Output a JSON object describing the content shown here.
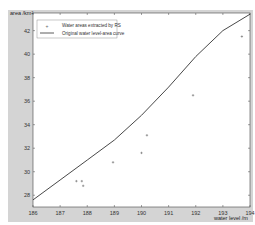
{
  "chart_data": {
    "type": "scatter",
    "title": "",
    "xlabel": "water level /m",
    "ylabel": "area /km²",
    "xlim": [
      186,
      194
    ],
    "ylim": [
      27,
      43.5
    ],
    "x_ticks": [
      186,
      187,
      188,
      189,
      190,
      191,
      192,
      193,
      194
    ],
    "y_ticks": [
      28,
      30,
      32,
      34,
      36,
      38,
      40,
      42
    ],
    "grid": false,
    "legend_position": "upper left",
    "series": [
      {
        "name": "Water areas extracted by RS",
        "kind": "scatter",
        "marker": "+",
        "points": [
          {
            "x": 187.6,
            "y": 29.2
          },
          {
            "x": 187.8,
            "y": 29.2
          },
          {
            "x": 187.85,
            "y": 28.8
          },
          {
            "x": 188.95,
            "y": 30.8
          },
          {
            "x": 190.0,
            "y": 31.6
          },
          {
            "x": 190.2,
            "y": 33.1
          },
          {
            "x": 191.9,
            "y": 36.5
          },
          {
            "x": 193.7,
            "y": 41.5
          }
        ]
      },
      {
        "name": "Original water level-area curve",
        "kind": "line",
        "points": [
          {
            "x": 186.0,
            "y": 27.6
          },
          {
            "x": 187.0,
            "y": 29.3
          },
          {
            "x": 188.0,
            "y": 31.0
          },
          {
            "x": 189.0,
            "y": 32.7
          },
          {
            "x": 190.0,
            "y": 34.8
          },
          {
            "x": 191.0,
            "y": 37.2
          },
          {
            "x": 192.0,
            "y": 39.8
          },
          {
            "x": 193.0,
            "y": 42.0
          },
          {
            "x": 194.0,
            "y": 43.4
          }
        ]
      }
    ]
  },
  "colors": {
    "figure_bg": "#d4d4d4",
    "plot_bg": "#ffffff",
    "line": "#333333",
    "marker": "#555555"
  }
}
